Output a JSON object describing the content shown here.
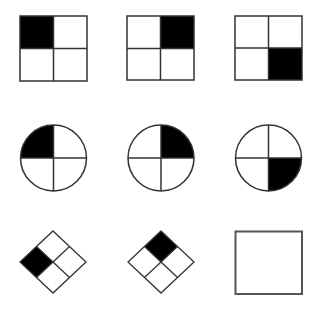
{
  "puzzle": {
    "type": "progressive-matrix",
    "rows": 3,
    "cols": 3,
    "colors": {
      "fill": "#000000",
      "stroke": "#333333",
      "background": "#ffffff",
      "answer_stroke": "#555555"
    },
    "cells": [
      {
        "row": 0,
        "col": 0,
        "shape": "square",
        "filled_quadrant": "top-left"
      },
      {
        "row": 0,
        "col": 1,
        "shape": "square",
        "filled_quadrant": "top-right"
      },
      {
        "row": 0,
        "col": 2,
        "shape": "square",
        "filled_quadrant": "bottom-right"
      },
      {
        "row": 1,
        "col": 0,
        "shape": "circle",
        "filled_quadrant": "top-left"
      },
      {
        "row": 1,
        "col": 1,
        "shape": "circle",
        "filled_quadrant": "top-right"
      },
      {
        "row": 1,
        "col": 2,
        "shape": "circle",
        "filled_quadrant": "bottom-right"
      },
      {
        "row": 2,
        "col": 0,
        "shape": "diamond",
        "filled_quadrant": "left"
      },
      {
        "row": 2,
        "col": 1,
        "shape": "diamond",
        "filled_quadrant": "top"
      },
      {
        "row": 2,
        "col": 2,
        "shape": "empty-answer-box",
        "filled_quadrant": null
      }
    ]
  }
}
